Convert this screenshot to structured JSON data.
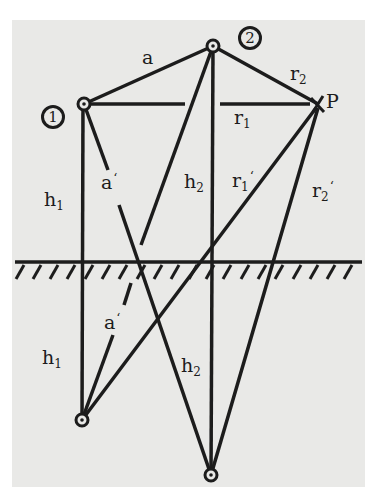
{
  "diagram": {
    "type": "mirror-image source geometry above ground plane",
    "colors": {
      "background": "#e9e9e7",
      "ink": "#1c1c1c",
      "page": "#ffffff"
    },
    "points": {
      "source_1": {
        "marker": "1",
        "x": 84,
        "y": 104
      },
      "source_2": {
        "marker": "2",
        "x": 213,
        "y": 46
      },
      "receiver": {
        "label": "P",
        "x": 318,
        "y": 104
      },
      "image_1": {
        "x": 82,
        "y": 420
      },
      "image_2": {
        "x": 211,
        "y": 475
      }
    },
    "ground": {
      "y": 262,
      "x_start": 15,
      "x_end": 362,
      "hatch_count": 20
    },
    "labels": {
      "a": "a",
      "a_prime_upper": "a",
      "a_prime_lower": "a",
      "prime": "‘",
      "r2": "r",
      "r2_sub": "2",
      "r1": "r",
      "r1_sub": "1",
      "r1_prime": "r",
      "r1_prime_sub": "1",
      "r2_prime": "r",
      "r2_prime_sub": "2",
      "h1_upper": "h",
      "h1_upper_sub": "1",
      "h1_lower": "h",
      "h1_lower_sub": "1",
      "h2_upper": "h",
      "h2_upper_sub": "2",
      "h2_lower": "h",
      "h2_lower_sub": "2",
      "P": "P",
      "marker_1": "1",
      "marker_2": "2"
    },
    "segments": [
      {
        "name": "a",
        "from": "source_1",
        "to": "source_2"
      },
      {
        "name": "r1",
        "from": "source_1",
        "to": "receiver"
      },
      {
        "name": "r2",
        "from": "source_2",
        "to": "receiver"
      },
      {
        "name": "h1",
        "from": "source_1",
        "to": "image_1"
      },
      {
        "name": "h2",
        "from": "source_2",
        "to": "image_2"
      },
      {
        "name": "a-prime-1",
        "from": "source_1",
        "to": "image_2"
      },
      {
        "name": "a-prime-2",
        "from": "source_2",
        "to": "image_1"
      },
      {
        "name": "r1-prime",
        "from": "receiver",
        "to": "image_1"
      },
      {
        "name": "r2-prime",
        "from": "receiver",
        "to": "image_2"
      }
    ]
  }
}
